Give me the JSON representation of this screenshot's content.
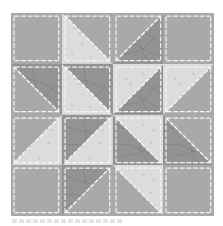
{
  "quilt_block": {
    "grid": {
      "rows": 4,
      "cols": 4
    },
    "colors": {
      "gray": "#a9a9a9",
      "light": "#dcdcdc",
      "dark": "#939393",
      "dark_vein": "#7a7a7a",
      "stitch": "#f4f4f4"
    },
    "cells": [
      [
        {
          "type": "solid",
          "fill": "gray"
        },
        {
          "type": "hst",
          "diag": "tl-br",
          "a": "light",
          "b": "gray"
        },
        {
          "type": "hst",
          "diag": "bl-tr",
          "a": "gray",
          "b": "dark"
        },
        {
          "type": "solid",
          "fill": "gray"
        }
      ],
      [
        {
          "type": "hst",
          "diag": "tl-br",
          "a": "gray",
          "b": "dark"
        },
        {
          "type": "hst",
          "diag": "tl-br",
          "a": "light",
          "b": "dark"
        },
        {
          "type": "hst",
          "diag": "bl-tr",
          "a": "light",
          "b": "dark"
        },
        {
          "type": "hst",
          "diag": "bl-tr",
          "a": "light",
          "b": "gray"
        }
      ],
      [
        {
          "type": "hst",
          "diag": "bl-tr",
          "a": "gray",
          "b": "light"
        },
        {
          "type": "hst",
          "diag": "bl-tr",
          "a": "dark",
          "b": "light"
        },
        {
          "type": "hst",
          "diag": "tl-br",
          "a": "dark",
          "b": "light"
        },
        {
          "type": "hst",
          "diag": "tl-br",
          "a": "dark",
          "b": "gray"
        }
      ],
      [
        {
          "type": "solid",
          "fill": "gray"
        },
        {
          "type": "hst",
          "diag": "bl-tr",
          "a": "dark",
          "b": "gray"
        },
        {
          "type": "hst",
          "diag": "tl-br",
          "a": "gray",
          "b": "light"
        },
        {
          "type": "solid",
          "fill": "gray"
        }
      ]
    ]
  }
}
